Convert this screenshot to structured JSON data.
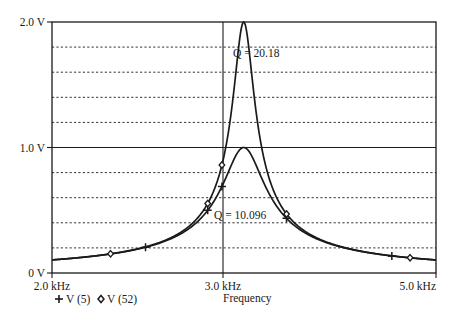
{
  "chart_data": {
    "type": "line",
    "title": "",
    "xlabel": "Frequency",
    "ylabel": "",
    "x_scale": "log",
    "xlim_khz": [
      2.0,
      5.0
    ],
    "ylim_v": [
      0,
      2.0
    ],
    "x_tick_labels": [
      "2.0 kHz",
      "3.0 kHz",
      "5.0 kHz"
    ],
    "x_ticks_khz": [
      2.0,
      3.0,
      5.0
    ],
    "y_tick_labels": [
      "0 V",
      "1.0 V",
      "2.0 V"
    ],
    "y_ticks_v": [
      0,
      1.0,
      2.0
    ],
    "y_minor_grid_step_v": 0.2,
    "grid": "dotted horizontal every 0.2 V, solid at 1.0 V and vertical at 3.0 kHz",
    "legend_position": "bottom-left",
    "series": [
      {
        "name": "V (5)",
        "marker": "plus",
        "peak_v": 1.0,
        "resonant_freq_khz": 3.16,
        "Q": 10.096,
        "points": [
          {
            "f_khz": 2.0,
            "v": 0.1
          },
          {
            "f_khz": 2.5,
            "v": 0.19
          },
          {
            "f_khz": 2.9,
            "v": 0.42
          },
          {
            "f_khz": 3.0,
            "v": 0.56
          },
          {
            "f_khz": 3.16,
            "v": 1.0
          },
          {
            "f_khz": 3.5,
            "v": 0.5
          },
          {
            "f_khz": 4.5,
            "v": 0.17
          },
          {
            "f_khz": 5.0,
            "v": 0.13
          }
        ]
      },
      {
        "name": "V (52)",
        "marker": "diamond",
        "peak_v": 2.0,
        "resonant_freq_khz": 3.16,
        "Q": 20.18,
        "points": [
          {
            "f_khz": 2.0,
            "v": 0.1
          },
          {
            "f_khz": 2.3,
            "v": 0.14
          },
          {
            "f_khz": 2.9,
            "v": 0.44
          },
          {
            "f_khz": 3.0,
            "v": 0.64
          },
          {
            "f_khz": 3.16,
            "v": 2.0
          },
          {
            "f_khz": 3.5,
            "v": 0.32
          },
          {
            "f_khz": 4.7,
            "v": 0.13
          },
          {
            "f_khz": 5.0,
            "v": 0.12
          }
        ]
      }
    ],
    "annotations": [
      {
        "text": "Q = 20.18",
        "near_series": "V (52)"
      },
      {
        "text": "Q = 10.096",
        "near_series": "V (5)"
      }
    ]
  },
  "labels": {
    "y_top": "2.0 V",
    "y_mid": "1.0 V",
    "y_bottom": "0 V",
    "x_left": "2.0 kHz",
    "x_mid": "3.0 kHz",
    "x_right": "5.0 kHz",
    "x_axis_title": "Frequency",
    "legend_v5": "V (5)",
    "legend_v52": "V (52)",
    "q_high": "Q = 20.18",
    "q_low": "Q = 10.096"
  },
  "colors": {
    "line": "#1a1a1a",
    "grid": "#333333",
    "background": "#ffffff"
  }
}
